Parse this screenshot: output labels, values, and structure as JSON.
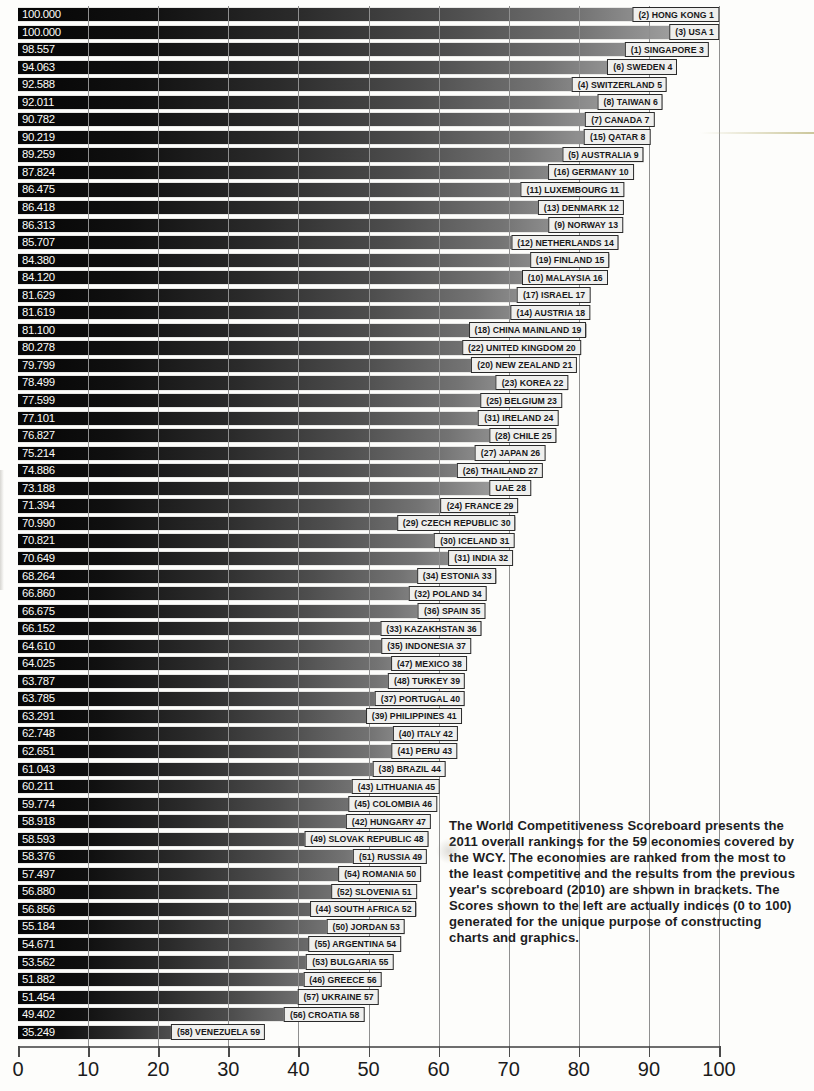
{
  "chart_data": {
    "type": "bar",
    "orientation": "horizontal",
    "xlabel": "",
    "ylabel": "",
    "xlim": [
      0,
      100
    ],
    "xticks": [
      0,
      10,
      20,
      30,
      40,
      50,
      60,
      70,
      80,
      90,
      100
    ],
    "grid": true,
    "grid_axis": "x",
    "series_name": "Competitiveness Index (0 to 100)",
    "categories": [
      "HONG KONG",
      "USA",
      "SINGAPORE",
      "SWEDEN",
      "SWITZERLAND",
      "TAIWAN",
      "CANADA",
      "QATAR",
      "AUSTRALIA",
      "GERMANY",
      "LUXEMBOURG",
      "DENMARK",
      "NORWAY",
      "NETHERLANDS",
      "FINLAND",
      "MALAYSIA",
      "ISRAEL",
      "AUSTRIA",
      "CHINA MAINLAND",
      "UNITED KINGDOM",
      "NEW ZEALAND",
      "KOREA",
      "BELGIUM",
      "IRELAND",
      "CHILE",
      "JAPAN",
      "THAILAND",
      "UAE",
      "FRANCE",
      "CZECH REPUBLIC",
      "ICELAND",
      "INDIA",
      "ESTONIA",
      "POLAND",
      "SPAIN",
      "KAZAKHSTAN",
      "INDONESIA",
      "MEXICO",
      "TURKEY",
      "PORTUGAL",
      "PHILIPPINES",
      "ITALY",
      "PERU",
      "BRAZIL",
      "LITHUANIA",
      "COLOMBIA",
      "HUNGARY",
      "SLOVAK REPUBLIC",
      "RUSSIA",
      "ROMANIA",
      "SLOVENIA",
      "SOUTH AFRICA",
      "JORDAN",
      "ARGENTINA",
      "BULGARIA",
      "GREECE",
      "UKRAINE",
      "CROATIA",
      "VENEZUELA"
    ],
    "values": [
      100.0,
      100.0,
      98.557,
      94.063,
      92.588,
      92.011,
      90.782,
      90.219,
      89.259,
      87.824,
      86.475,
      86.418,
      86.313,
      85.707,
      84.38,
      84.12,
      81.629,
      81.619,
      81.1,
      80.278,
      79.799,
      78.499,
      77.599,
      77.101,
      76.827,
      75.214,
      74.886,
      73.188,
      71.394,
      70.99,
      70.821,
      70.649,
      68.264,
      66.86,
      66.675,
      66.152,
      64.61,
      64.025,
      63.787,
      63.785,
      63.291,
      62.748,
      62.651,
      61.043,
      60.211,
      59.774,
      58.918,
      58.593,
      58.376,
      57.497,
      56.88,
      56.856,
      55.184,
      54.671,
      53.562,
      51.882,
      51.454,
      49.402,
      35.249
    ],
    "rank_2011": [
      1,
      1,
      3,
      4,
      5,
      6,
      7,
      8,
      9,
      10,
      11,
      12,
      13,
      14,
      15,
      16,
      17,
      18,
      19,
      20,
      21,
      22,
      23,
      24,
      25,
      26,
      27,
      28,
      29,
      30,
      31,
      32,
      33,
      34,
      35,
      36,
      37,
      38,
      39,
      40,
      41,
      42,
      43,
      44,
      45,
      46,
      47,
      48,
      49,
      50,
      51,
      52,
      53,
      54,
      55,
      56,
      57,
      58,
      59
    ],
    "rank_2010_prev": [
      "2",
      "3",
      "1",
      "6",
      "4",
      "8",
      "7",
      "15",
      "5",
      "16",
      "11",
      "13",
      "9",
      "12",
      "19",
      "10",
      "17",
      "14",
      "18",
      "22",
      "20",
      "23",
      "25",
      "31",
      "28",
      "27",
      "26",
      "",
      "24",
      "29",
      "30",
      "31",
      "34",
      "32",
      "36",
      "33",
      "35",
      "47",
      "48",
      "37",
      "39",
      "40",
      "41",
      "38",
      "43",
      "45",
      "42",
      "49",
      "51",
      "54",
      "52",
      "44",
      "50",
      "55",
      "53",
      "46",
      "57",
      "56",
      "58"
    ],
    "score_labels": [
      "100.000",
      "100.000",
      "98.557",
      "94.063",
      "92.588",
      "92.011",
      "90.782",
      "90.219",
      "89.259",
      "87.824",
      "86.475",
      "86.418",
      "86.313",
      "85.707",
      "84.380",
      "84.120",
      "81.629",
      "81.619",
      "81.100",
      "80.278",
      "79.799",
      "78.499",
      "77.599",
      "77.101",
      "76.827",
      "75.214",
      "74.886",
      "73.188",
      "71.394",
      "70.990",
      "70.821",
      "70.649",
      "68.264",
      "66.860",
      "66.675",
      "66.152",
      "64.610",
      "64.025",
      "63.787",
      "63.785",
      "63.291",
      "62.748",
      "62.651",
      "61.043",
      "60.211",
      "59.774",
      "58.918",
      "58.593",
      "58.376",
      "57.497",
      "56.880",
      "56.856",
      "55.184",
      "54.671",
      "53.562",
      "51.882",
      "51.454",
      "49.402",
      "35.249"
    ],
    "bar_labels": [
      "(2) HONG KONG 1",
      "(3) USA 1",
      "(1) SINGAPORE 3",
      "(6) SWEDEN 4",
      "(4) SWITZERLAND 5",
      "(8) TAIWAN 6",
      "(7) CANADA 7",
      "(15) QATAR 8",
      "(5) AUSTRALIA 9",
      "(16) GERMANY 10",
      "(11) LUXEMBOURG 11",
      "(13) DENMARK 12",
      "(9) NORWAY 13",
      "(12) NETHERLANDS 14",
      "(19) FINLAND 15",
      "(10) MALAYSIA 16",
      "(17) ISRAEL 17",
      "(14) AUSTRIA 18",
      "(18) CHINA MAINLAND 19",
      "(22) UNITED KINGDOM 20",
      "(20) NEW ZEALAND 21",
      "(23) KOREA 22",
      "(25) BELGIUM 23",
      "(31) IRELAND 24",
      "(28) CHILE 25",
      "(27) JAPAN 26",
      "(26) THAILAND 27",
      "UAE 28",
      "(24) FRANCE 29",
      "(29) CZECH REPUBLIC 30",
      "(30) ICELAND 31",
      "(31) INDIA 32",
      "(34) ESTONIA 33",
      "(32) POLAND 34",
      "(36) SPAIN 35",
      "(33) KAZAKHSTAN 36",
      "(35) INDONESIA 37",
      "(47) MEXICO 38",
      "(48) TURKEY 39",
      "(37) PORTUGAL 40",
      "(39) PHILIPPINES 41",
      "(40) ITALY 42",
      "(41) PERU 43",
      "(38) BRAZIL 44",
      "(43) LITHUANIA 45",
      "(45) COLOMBIA 46",
      "(42) HUNGARY 47",
      "(49) SLOVAK REPUBLIC 48",
      "(51) RUSSIA 49",
      "(54) ROMANIA 50",
      "(52) SLOVENIA 51",
      "(44) SOUTH AFRICA 52",
      "(50) JORDAN 53",
      "(55) ARGENTINA 54",
      "(53) BULGARIA 55",
      "(46) GREECE 56",
      "(57) UKRAINE 57",
      "(56) CROATIA 58",
      "(58) VENEZUELA 59"
    ]
  },
  "axis": {
    "tick_labels": [
      "0",
      "10",
      "20",
      "30",
      "40",
      "50",
      "60",
      "70",
      "80",
      "90",
      "100"
    ]
  },
  "caption": {
    "text": "The World Competitiveness Scoreboard presents the 2011 overall rankings for the 59 economies covered by the WCY. The economies are ranked from the most to the least competitive and the results from the previous year's scoreboard (2010) are shown in brackets. The Scores shown to the left are actually indices (0 to 100) generated for the unique purpose of constructing charts and graphics."
  }
}
